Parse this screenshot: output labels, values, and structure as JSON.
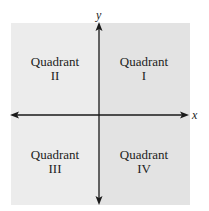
{
  "diagram": {
    "axes": {
      "x_label": "x",
      "y_label": "y"
    },
    "quadrants": [
      {
        "id": "I",
        "line1": "Quadrant",
        "line2": "I"
      },
      {
        "id": "II",
        "line1": "Quadrant",
        "line2": "II"
      },
      {
        "id": "III",
        "line1": "Quadrant",
        "line2": "III"
      },
      {
        "id": "IV",
        "line1": "Quadrant",
        "line2": "IV"
      }
    ],
    "colors": {
      "left_shade": "#ececec",
      "right_shade": "#e4e4e4",
      "axis": "#1a1a1a",
      "text": "#222222"
    }
  }
}
